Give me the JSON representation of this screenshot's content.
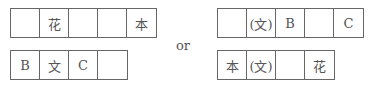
{
  "connector": "or",
  "left": {
    "top_row": [
      "",
      "花",
      "",
      "",
      "本"
    ],
    "bottom_row": [
      "B",
      "文",
      "C",
      ""
    ]
  },
  "right": {
    "top_row": [
      "",
      "(文)",
      "B",
      "",
      "C"
    ],
    "bottom_row": [
      "本",
      "(文)",
      "",
      "花"
    ]
  }
}
